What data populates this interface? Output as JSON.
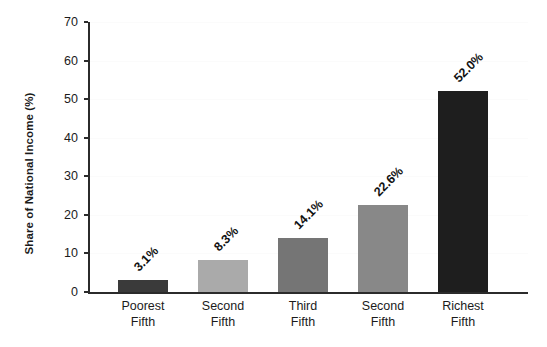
{
  "chart_data": {
    "type": "bar",
    "title": "",
    "xlabel": "",
    "ylabel": "Share of National Income (%)",
    "categories": [
      "Poorest Fifth",
      "Second Fifth",
      "Third Fifth",
      "Second Fifth",
      "Richest Fifth"
    ],
    "category_lines": [
      [
        "Poorest",
        "Fifth"
      ],
      [
        "Second",
        "Fifth"
      ],
      [
        "Third",
        "Fifth"
      ],
      [
        "Second",
        "Fifth"
      ],
      [
        "Richest",
        "Fifth"
      ]
    ],
    "values": [
      3.1,
      8.3,
      14.1,
      22.6,
      52.0
    ],
    "value_labels": [
      "3.1%",
      "8.3%",
      "14.1%",
      "22.6%",
      "52.0%"
    ],
    "bar_colors": [
      "#3a3a3a",
      "#aaaaaa",
      "#757575",
      "#888888",
      "#1e1e1e"
    ],
    "ylim": [
      0,
      70
    ],
    "yticks": [
      0,
      10,
      20,
      30,
      40,
      50,
      60,
      70
    ],
    "ytick_labels": [
      "0",
      "10",
      "20",
      "30",
      "40",
      "50",
      "60",
      "70"
    ],
    "grid": true,
    "legend": false,
    "legend_position": "none",
    "value_label_rotation": 45
  }
}
